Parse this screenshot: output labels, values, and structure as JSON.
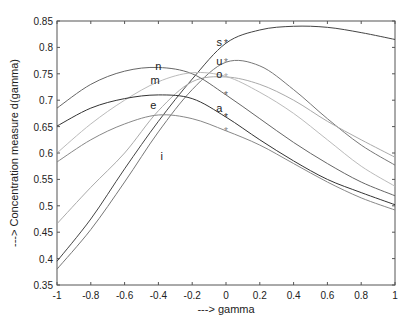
{
  "chart_data": {
    "type": "line",
    "title": "",
    "xlabel": "---> gamma",
    "ylabel": "---> Concentration measure d(gamma)",
    "xlim": [
      -1,
      1
    ],
    "ylim": [
      0.35,
      0.85
    ],
    "x_ticks": [
      "-1",
      "-0.8",
      "-0.6",
      "-0.4",
      "-0.2",
      "0",
      "0.2",
      "0.4",
      "0.6",
      "0.8",
      "1"
    ],
    "y_ticks": [
      "0.35",
      "0.4",
      "0.45",
      "0.5",
      "0.55",
      "0.6",
      "0.65",
      "0.7",
      "0.75",
      "0.8",
      "0.85"
    ],
    "grid": false,
    "legend": "none (inline curve labels)",
    "series": [
      {
        "name": "s",
        "color": "#444444",
        "x": [
          -1,
          -0.8,
          -0.6,
          -0.4,
          -0.2,
          0,
          0.2,
          0.4,
          0.6,
          0.8,
          1
        ],
        "values": [
          0.395,
          0.475,
          0.57,
          0.66,
          0.74,
          0.808,
          0.833,
          0.84,
          0.838,
          0.828,
          0.815
        ],
        "marker_at_0": "*"
      },
      {
        "name": "u",
        "color": "#777777",
        "x": [
          -1,
          -0.8,
          -0.6,
          -0.4,
          -0.2,
          0,
          0.2,
          0.4,
          0.6,
          0.8,
          1
        ],
        "values": [
          0.38,
          0.455,
          0.545,
          0.64,
          0.72,
          0.772,
          0.765,
          0.72,
          0.665,
          0.615,
          0.577
        ],
        "marker_at_0": "*"
      },
      {
        "name": "o",
        "color": "#aaaaaa",
        "x": [
          -1,
          -0.8,
          -0.6,
          -0.4,
          -0.2,
          0,
          0.2,
          0.4,
          0.6,
          0.8,
          1
        ],
        "values": [
          0.466,
          0.535,
          0.6,
          0.68,
          0.735,
          0.744,
          0.73,
          0.7,
          0.66,
          0.625,
          0.592
        ],
        "marker_at_0": "*"
      },
      {
        "name": "n",
        "color": "#666666",
        "x": [
          -1,
          -0.8,
          -0.6,
          -0.4,
          -0.2,
          0,
          0.2,
          0.4,
          0.6,
          0.8,
          1
        ],
        "values": [
          0.685,
          0.73,
          0.755,
          0.762,
          0.75,
          0.71,
          0.665,
          0.62,
          0.58,
          0.545,
          0.519
        ],
        "marker_at_0": "*"
      },
      {
        "name": "m",
        "color": "#bbbbbb",
        "x": [
          -1,
          -0.8,
          -0.6,
          -0.4,
          -0.2,
          0,
          0.2,
          0.4,
          0.6,
          0.8,
          1
        ],
        "values": [
          0.6,
          0.655,
          0.7,
          0.735,
          0.752,
          0.745,
          0.715,
          0.675,
          0.625,
          0.575,
          0.537
        ]
      },
      {
        "name": "e",
        "color": "#333333",
        "x": [
          -1,
          -0.8,
          -0.6,
          -0.4,
          -0.2,
          0,
          0.2,
          0.4,
          0.6,
          0.8,
          1
        ],
        "values": [
          0.651,
          0.685,
          0.703,
          0.71,
          0.703,
          0.668,
          0.625,
          0.585,
          0.55,
          0.525,
          0.502
        ],
        "marker_at_0": "*"
      },
      {
        "name": "i",
        "color": "#888888",
        "x": [
          -1,
          -0.8,
          -0.6,
          -0.4,
          -0.2,
          0,
          0.2,
          0.4,
          0.6,
          0.8,
          1
        ],
        "values": [
          0.583,
          0.625,
          0.655,
          0.672,
          0.665,
          0.642,
          0.615,
          0.58,
          0.545,
          0.515,
          0.492
        ],
        "marker_at_0": "*"
      }
    ],
    "annotations": [
      {
        "text": "s",
        "x": -0.04,
        "y": 0.81
      },
      {
        "text": "u",
        "x": -0.04,
        "y": 0.775
      },
      {
        "text": "o",
        "x": -0.04,
        "y": 0.75
      },
      {
        "text": "a",
        "x": -0.04,
        "y": 0.685
      },
      {
        "text": "n",
        "x": -0.4,
        "y": 0.765
      },
      {
        "text": "m",
        "x": -0.42,
        "y": 0.738
      },
      {
        "text": "e",
        "x": -0.43,
        "y": 0.69
      },
      {
        "text": "i",
        "x": -0.38,
        "y": 0.595
      }
    ]
  }
}
